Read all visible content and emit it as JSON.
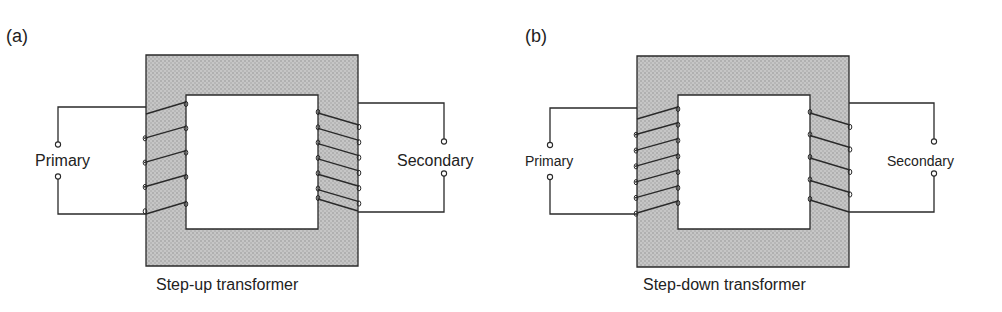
{
  "figure": {
    "colors": {
      "core_fill": "#c4c4c4",
      "core_dots": "#9a9a9a",
      "line": "#2a2a2a",
      "background": "#ffffff"
    },
    "panels": [
      {
        "id": "a",
        "label": "(a)",
        "caption": "Step-up transformer",
        "primary_label": "Primary",
        "secondary_label": "Secondary",
        "primary_turns": 5,
        "secondary_turns": 7,
        "core": {
          "outer": [
            146,
            55,
            358,
            266
          ],
          "inner": [
            186,
            95,
            318,
            229
          ]
        },
        "primary_terminal_x": 58,
        "secondary_terminal_x": 444,
        "primary_wire_y": [
          107,
          214
        ],
        "secondary_wire_y": [
          103,
          212
        ],
        "primary_coil_y": [
          107,
          214
        ],
        "secondary_coil_y": [
          113,
          211
        ]
      },
      {
        "id": "b",
        "label": "(b)",
        "caption": "Step-down transformer",
        "primary_label": "Primary",
        "secondary_label": "Secondary",
        "primary_turns": 7,
        "secondary_turns": 5,
        "core": {
          "outer": [
            637,
            56,
            849,
            267
          ],
          "inner": [
            678,
            95,
            810,
            229
          ]
        },
        "primary_terminal_x": 550,
        "secondary_terminal_x": 934,
        "primary_wire_y": [
          108,
          214
        ],
        "secondary_wire_y": [
          103,
          212
        ],
        "primary_coil_y": [
          112,
          213
        ],
        "secondary_coil_y": [
          113,
          212
        ]
      }
    ]
  }
}
